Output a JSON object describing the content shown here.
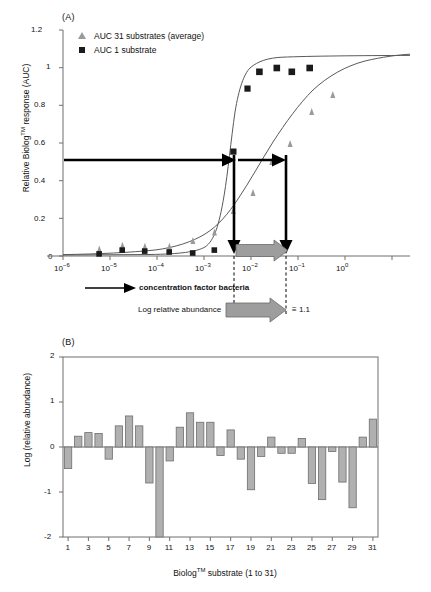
{
  "figure": {
    "panel_a_label": "(A)",
    "panel_b_label": "(B)"
  },
  "annotations": {
    "concentration_factor": "concentration factor bacteria",
    "log_relative_abundance": "Log relative abundance",
    "equals_value": "≡ 1.1"
  },
  "chart_data": [
    {
      "type": "scatter",
      "panel": "A",
      "title": "(A)",
      "xlabel": "concentration factor bacteria",
      "ylabel": "Relative Biolog™ response (AUC)",
      "xlim": [
        -6.35,
        0.55
      ],
      "ylim": [
        0,
        1.2
      ],
      "xscale": "log",
      "grid": false,
      "legend_position": "top-left",
      "xticks": [
        "10−6",
        "10−5",
        "10−4",
        "10−3",
        "10−2",
        "10−1",
        "10⁰"
      ],
      "xtick_exponents": [
        -6,
        -5,
        -4,
        -3,
        -2,
        -1,
        0
      ],
      "yticks": [
        "0",
        "0.2",
        "0.4",
        "0.6",
        "0.8",
        "1",
        "1.2"
      ],
      "ytick_values": [
        0,
        0.2,
        0.4,
        0.6,
        0.8,
        1.0,
        1.2
      ],
      "series": [
        {
          "name": "AUC 31 substrates (average)",
          "marker": "triangle",
          "color": "#9a9a9a",
          "points": [
            {
              "x": -5.28,
              "y": 0.015
            },
            {
              "x": -4.78,
              "y": 0.035
            },
            {
              "x": -4.3,
              "y": 0.03
            },
            {
              "x": -3.78,
              "y": 0.03
            },
            {
              "x": -3.28,
              "y": 0.06
            },
            {
              "x": -2.82,
              "y": 0.105
            },
            {
              "x": -2.42,
              "y": 0.22
            },
            {
              "x": -2.0,
              "y": 0.315
            },
            {
              "x": -1.6,
              "y": 0.48
            },
            {
              "x": -1.21,
              "y": 0.575
            },
            {
              "x": -0.75,
              "y": 0.745
            },
            {
              "x": -0.3,
              "y": 0.835
            }
          ],
          "fit": {
            "model": "logistic",
            "ec50_log": -1.55,
            "slope": 1.15,
            "top": 0.98,
            "bottom": 0.005
          }
        },
        {
          "name": "AUC 1 substrate",
          "marker": "square",
          "color": "#1b1b1b",
          "points": [
            {
              "x": -5.28,
              "y": 0.01
            },
            {
              "x": -4.78,
              "y": 0.03
            },
            {
              "x": -4.3,
              "y": 0.025
            },
            {
              "x": -3.78,
              "y": 0.02
            },
            {
              "x": -3.28,
              "y": 0.015
            },
            {
              "x": -2.82,
              "y": 0.03
            },
            {
              "x": -2.42,
              "y": 0.555
            },
            {
              "x": -2.12,
              "y": 0.89
            },
            {
              "x": -1.87,
              "y": 0.98
            },
            {
              "x": -1.5,
              "y": 1.0
            },
            {
              "x": -1.18,
              "y": 0.98
            },
            {
              "x": -0.8,
              "y": 1.0
            }
          ],
          "fit": {
            "model": "logistic",
            "ec50_log": -2.42,
            "slope": 4.2,
            "top": 1.0,
            "bottom": 0.005
          }
        }
      ],
      "reference_lines": {
        "half_max_y": 0.51,
        "ec50_single_substrate_log": -2.42,
        "ec50_31_substrates_log": -1.32,
        "log_relative_abundance": 1.1
      }
    },
    {
      "type": "bar",
      "panel": "B",
      "title": "(B)",
      "xlabel": "Biolog™ substrate (1 to 31)",
      "ylabel": "Log (relative abundance)",
      "ylim": [
        -2,
        2
      ],
      "grid": false,
      "yticks": [
        "-2",
        "-1",
        "0",
        "1",
        "2"
      ],
      "ytick_values": [
        -2,
        -1,
        0,
        1,
        2
      ],
      "xticks": [
        "1",
        "3",
        "5",
        "7",
        "9",
        "11",
        "13",
        "15",
        "17",
        "19",
        "21",
        "23",
        "25",
        "27",
        "29",
        "31"
      ],
      "xtick_values": [
        1,
        3,
        5,
        7,
        9,
        11,
        13,
        15,
        17,
        19,
        21,
        23,
        25,
        27,
        29,
        31
      ],
      "categories": [
        1,
        2,
        3,
        4,
        5,
        6,
        7,
        8,
        9,
        10,
        11,
        12,
        13,
        14,
        15,
        16,
        17,
        18,
        19,
        20,
        21,
        22,
        23,
        24,
        25,
        26,
        27,
        28,
        29,
        30,
        31
      ],
      "values": [
        -0.48,
        0.24,
        0.32,
        0.3,
        -0.27,
        0.47,
        0.69,
        0.47,
        -0.8,
        -2.0,
        -0.31,
        0.44,
        0.76,
        0.55,
        0.55,
        -0.19,
        0.38,
        -0.27,
        -0.95,
        -0.21,
        0.22,
        -0.14,
        -0.14,
        0.19,
        -0.81,
        -1.17,
        -0.1,
        -0.78,
        -1.35,
        0.22,
        0.62
      ]
    }
  ]
}
